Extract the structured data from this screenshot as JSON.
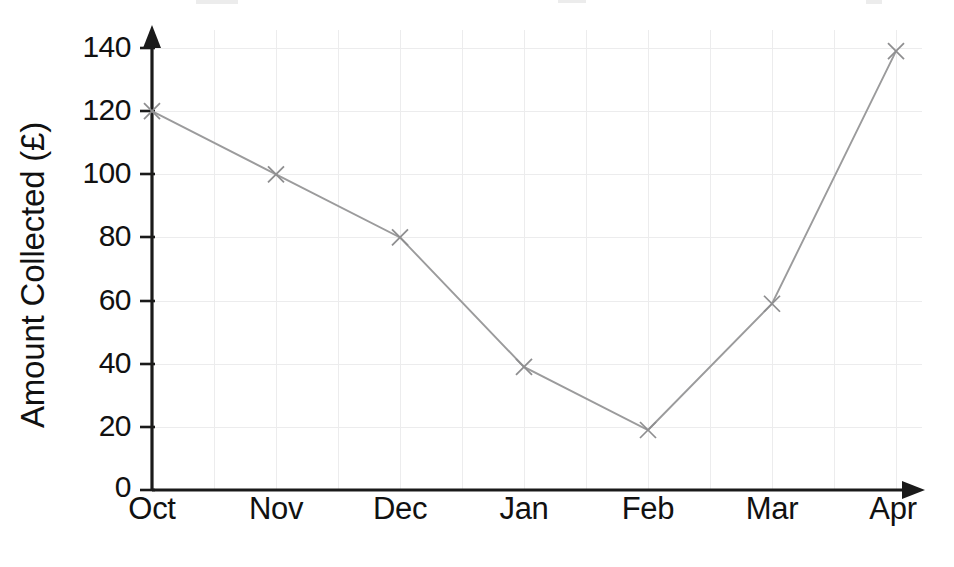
{
  "chart_data": {
    "type": "line",
    "title": "",
    "xlabel": "",
    "ylabel": "Amount Collected (£)",
    "categories": [
      "Oct",
      "Nov",
      "Dec",
      "Jan",
      "Feb",
      "Mar",
      "Apr"
    ],
    "values": [
      120,
      100,
      80,
      39,
      19,
      59,
      139
    ],
    "series": [
      {
        "name": "Amount Collected",
        "values": [
          120,
          100,
          80,
          39,
          19,
          59,
          139
        ],
        "color": "#9b9b9c",
        "marker": "x"
      }
    ],
    "ylim": [
      0,
      140
    ],
    "xlim": [
      "Oct",
      "Apr"
    ],
    "y_ticks": [
      0,
      20,
      40,
      60,
      80,
      100,
      120,
      140
    ],
    "y_tick_labels": [
      "0",
      "20",
      "40",
      "60",
      "80",
      "100",
      "120",
      "140"
    ],
    "x_tick_labels": [
      "Oct",
      "Nov",
      "Dec",
      "Jan",
      "Feb",
      "Mar",
      "Apr"
    ],
    "grid": true,
    "grid_color": "#ececed",
    "legend": false,
    "legend_position": "none",
    "axis_color": "#1a1a1a",
    "axis_style": "arrow-ended",
    "currency_symbol": "£"
  },
  "axes": {
    "y_title": "Amount Collected (£)",
    "y_labels": [
      "140",
      "120",
      "100",
      "80",
      "60",
      "40",
      "20",
      "0"
    ],
    "x_labels": [
      "Oct",
      "Nov",
      "Dec",
      "Jan",
      "Feb",
      "Mar",
      "Apr"
    ]
  }
}
